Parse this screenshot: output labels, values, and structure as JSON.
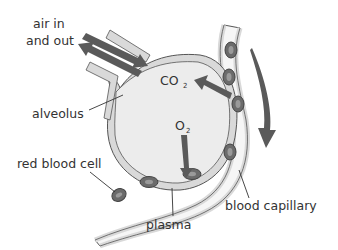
{
  "labels": {
    "air_line1": "air in",
    "air_line2": "and out",
    "alveolus": "alveolus",
    "red_blood_cell": "red blood cell",
    "plasma": "plasma",
    "blood_capillary": "blood capillary",
    "co2_main": "CO",
    "co2_sub": "2",
    "o2_main": "O",
    "o2_sub": "2"
  },
  "colors": {
    "arrow": "#5a5a5a",
    "wall_fill": "#d9d9d9",
    "alveolus_fill": "#ececec",
    "cell_fill": "#6b6b6b",
    "cell_core": "#9a9a9a",
    "outline": "#555555",
    "text": "#333333"
  }
}
